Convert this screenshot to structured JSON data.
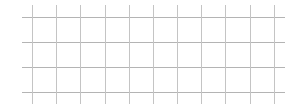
{
  "grid": {
    "background": "#ffffff",
    "line_color_horizontal": "#b4b4b4",
    "line_color_vertical": "#c4c4c4",
    "horizontal_lines": {
      "y": [
        17,
        42,
        67,
        92
      ],
      "x_start": 22,
      "x_end": 285
    },
    "vertical_lines": {
      "x": [
        32,
        56,
        80,
        105,
        129,
        153,
        177,
        201,
        225,
        250,
        274
      ],
      "y_start": 5,
      "y_end": 104
    }
  }
}
